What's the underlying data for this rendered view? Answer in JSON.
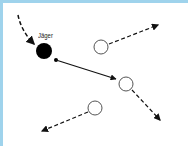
{
  "diagram": {
    "hunter_label": "Jäger",
    "colors": {
      "frame_border": "#9fd3ec",
      "stroke": "#111111",
      "prey_stroke": "#555555",
      "background": "#ffffff"
    },
    "nodes": [
      {
        "id": "hunter",
        "type": "filled-circle",
        "x": 44,
        "y": 51,
        "r": 8
      },
      {
        "id": "prey-1",
        "type": "hollow-circle",
        "x": 101,
        "y": 47,
        "r": 7
      },
      {
        "id": "prey-2",
        "type": "hollow-circle",
        "x": 126,
        "y": 84,
        "r": 7
      },
      {
        "id": "prey-3",
        "type": "hollow-circle",
        "x": 95,
        "y": 108,
        "r": 7
      }
    ],
    "arrows": [
      {
        "from": "incoming",
        "to": "hunter",
        "style": "dashed"
      },
      {
        "from": "hunter",
        "to": "prey-2",
        "style": "solid"
      },
      {
        "from": "prey-1",
        "to": "upper-right",
        "style": "dashed"
      },
      {
        "from": "prey-2",
        "to": "lower-right",
        "style": "dashed"
      },
      {
        "from": "prey-3",
        "to": "lower-left",
        "style": "dashed"
      }
    ]
  }
}
